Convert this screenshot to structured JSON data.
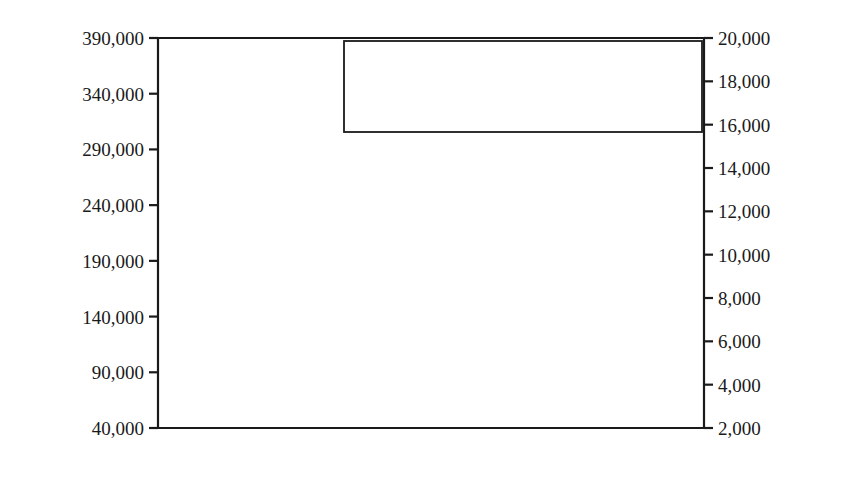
{
  "chart_data": {
    "type": "line",
    "title": "",
    "xlabel": "",
    "ylabel": "Pacific Flyway  states active hunters",
    "y2label": "Alaska, BC, Yukon active hunters",
    "xlim": [
      1975,
      2012
    ],
    "ylim": [
      40000,
      390000
    ],
    "y2lim": [
      2000,
      20000
    ],
    "grid": false,
    "legend_position": "top-right",
    "x": [
      1975,
      1976,
      1977,
      1978,
      1979,
      1980,
      1981,
      1982,
      1983,
      1984,
      1985,
      1986,
      1987,
      1988,
      1989,
      1990,
      1991,
      1992,
      1993,
      1994,
      1995,
      1996,
      1997,
      1998,
      1999,
      2000,
      2001,
      2002,
      2003,
      2004,
      2005,
      2006,
      2007,
      2008,
      2009,
      2010,
      2011
    ],
    "xticks": [
      1975,
      1980,
      1985,
      1990,
      1995,
      2000,
      2005,
      2010
    ],
    "xticklabels": [
      "1975",
      "1980",
      "1985",
      "1990",
      "1995",
      "2000",
      "2005",
      "2010"
    ],
    "yticks": [
      40000,
      90000,
      140000,
      190000,
      240000,
      290000,
      340000,
      390000
    ],
    "yticklabels": [
      "40,000",
      "90,000",
      "140,000",
      "190,000",
      "240,000",
      "290,000",
      "340,000",
      "390,000"
    ],
    "y2ticks": [
      2000,
      4000,
      6000,
      8000,
      10000,
      12000,
      14000,
      16000,
      18000,
      20000
    ],
    "y2ticklabels": [
      "2,000",
      "4,000",
      "6,000",
      "8,000",
      "10,000",
      "12,000",
      "14,000",
      "16,000",
      "18,000",
      "20,000"
    ],
    "series": [
      {
        "name": "Pacific Flyway US active hunters",
        "axis": "left",
        "style": "solid-double-black",
        "color": "#111111",
        "values": [
          336000,
          322000,
          312000,
          309000,
          300000,
          292000,
          280000,
          278000,
          265000,
          263000,
          268000,
          250000,
          223000,
          198000,
          182000,
          172000,
          165000,
          150000,
          152000,
          163000,
          178000,
          185000,
          212000,
          203000,
          190000,
          177000,
          174000,
          172000,
          176000,
          172000,
          170000,
          174000,
          178000,
          184000,
          166000,
          173000,
          156000
        ]
      },
      {
        "name": "Alaska active hunters",
        "axis": "right",
        "style": "solid-double-grey",
        "color": "#c3c3c3",
        "values": [
          10900,
          12800,
          13200,
          12600,
          13500,
          14500,
          12200,
          12600,
          11600,
          12000,
          12800,
          12300,
          10500,
          9600,
          10700,
          9200,
          9600,
          8000,
          8300,
          9200,
          9400,
          9800,
          10900,
          7300,
          6300,
          5900,
          5500,
          6000,
          5700,
          6100,
          5800,
          5400,
          5700,
          5600,
          8000,
          5800,
          4700
        ]
      },
      {
        "name": "BC–YT active hunters",
        "axis": "right",
        "style": "dashed-black",
        "color": "#111111",
        "values": [
          17300,
          18400,
          19300,
          18800,
          18100,
          18500,
          17800,
          18200,
          17600,
          13600,
          12600,
          12800,
          11100,
          10500,
          9700,
          9300,
          8700,
          8000,
          7300,
          6700,
          6600,
          6900,
          6800,
          6500,
          6200,
          5600,
          5000,
          4500,
          4100,
          4200,
          3900,
          3900,
          3900,
          4100,
          4000,
          3900,
          4300
        ]
      }
    ]
  },
  "legend": {
    "items": [
      {
        "label": "Pacific Flyway US active hunters",
        "swatch": "solid-double-black"
      },
      {
        "label": "Alaska active hunters",
        "swatch": "solid-double-grey"
      },
      {
        "label": "BC–YT active hunters",
        "swatch": "dashed-black"
      }
    ]
  },
  "colors": {
    "axis": "#1a1a1a",
    "primary": "#111111",
    "secondary": "#c3c3c3",
    "background": "#ffffff"
  }
}
